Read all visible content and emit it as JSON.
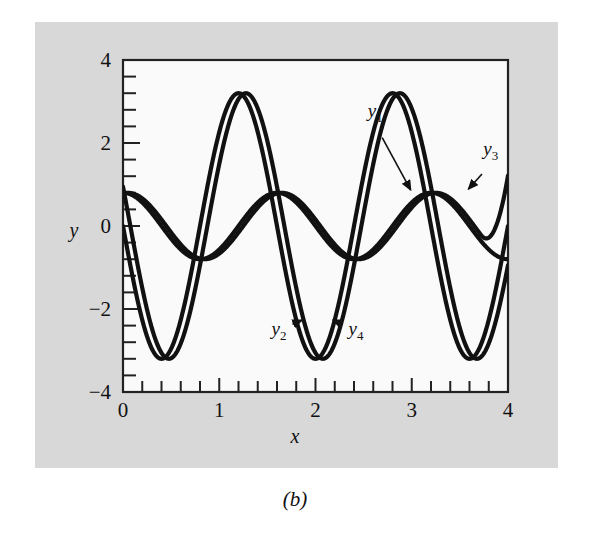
{
  "figure": {
    "caption": "(b)",
    "background_color": "#d8d8d8",
    "plot_background_color": "#fafafa",
    "curve_color": "#111111"
  },
  "chart_data": {
    "type": "line",
    "title": "",
    "xlabel": "x",
    "ylabel": "y",
    "xlim": [
      0,
      4
    ],
    "ylim": [
      -4,
      4
    ],
    "xticks": [
      0,
      1,
      2,
      3,
      4
    ],
    "xtick_labels": [
      "0",
      "1",
      "2",
      "3",
      "4"
    ],
    "yticks": [
      -4,
      -2,
      0,
      2,
      4
    ],
    "ytick_labels": [
      "-4",
      "-2",
      "0",
      "2",
      "4"
    ],
    "x_minor_tick_step": 0.2,
    "y_minor_tick_step": 0.4,
    "grid": false,
    "legend": "inline-annotations",
    "series": [
      {
        "name": "y1",
        "label": "y",
        "subscript": "1",
        "amplitude": 3.2,
        "period": 1.6,
        "phase": -0.45,
        "x_start": 0.0,
        "y_start": 0.0,
        "description": "large amplitude oscillation, minimum near x=0.4, maxima near x=1.2 and x=2.75"
      },
      {
        "name": "y2",
        "label": "y",
        "subscript": "2",
        "amplitude": 3.2,
        "period": 1.6,
        "phase": -0.52,
        "x_start": 0.0,
        "y_start": 0.0,
        "description": "large amplitude oscillation slightly lagging y1, minima near x=2.0 and x=3.6"
      },
      {
        "name": "y3",
        "label": "y",
        "subscript": "3",
        "amplitude": 0.8,
        "period": 1.6,
        "phase": 0.0,
        "x_start": 0.0,
        "y_start": 0.8,
        "description": "small amplitude oscillation starting at y=0.8, maxima near x=1.55 and x=3.15"
      },
      {
        "name": "y4",
        "label": "y",
        "subscript": "4",
        "amplitude": 0.8,
        "period": 1.6,
        "phase": 0.05,
        "x_start": 0.0,
        "y_start": 0.8,
        "description": "small amplitude oscillation nearly overlapping y3, rises steeply at right edge"
      }
    ],
    "annotations": [
      {
        "name": "y1",
        "text_x": 2.62,
        "text_y": 2.62,
        "arrow_to_x": 3.02,
        "arrow_to_y": 0.72
      },
      {
        "name": "y3",
        "text_x": 3.82,
        "text_y": 1.72,
        "arrow_to_x": 3.55,
        "arrow_to_y": 0.75
      },
      {
        "name": "y2",
        "text_x": 1.62,
        "text_y": -2.62,
        "arrow_to_x": 1.92,
        "arrow_to_y": -2.18
      },
      {
        "name": "y4",
        "text_x": 2.42,
        "text_y": -2.62,
        "arrow_to_x": 2.12,
        "arrow_to_y": -2.18
      }
    ]
  }
}
